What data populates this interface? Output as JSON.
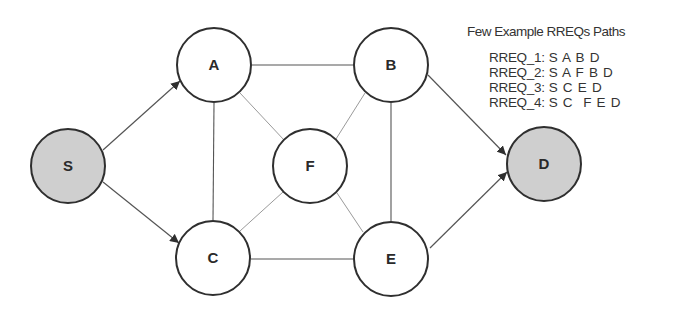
{
  "diagram": {
    "nodes": [
      {
        "id": "S",
        "label": "S",
        "cx": 68,
        "cy": 166,
        "r": 38,
        "fill": "#cfcfcf",
        "role": "source"
      },
      {
        "id": "A",
        "label": "A",
        "cx": 214,
        "cy": 65,
        "r": 38,
        "fill": "#ffffff",
        "role": "intermediate"
      },
      {
        "id": "B",
        "label": "B",
        "cx": 391,
        "cy": 65,
        "r": 38,
        "fill": "#ffffff",
        "role": "intermediate"
      },
      {
        "id": "F",
        "label": "F",
        "cx": 310,
        "cy": 166,
        "r": 38,
        "fill": "#ffffff",
        "role": "intermediate"
      },
      {
        "id": "C",
        "label": "C",
        "cx": 213,
        "cy": 258,
        "r": 38,
        "fill": "#ffffff",
        "role": "intermediate"
      },
      {
        "id": "E",
        "label": "E",
        "cx": 391,
        "cy": 259,
        "r": 38,
        "fill": "#ffffff",
        "role": "intermediate"
      },
      {
        "id": "D",
        "label": "D",
        "cx": 544,
        "cy": 164,
        "r": 38,
        "fill": "#cfcfcf",
        "role": "destination"
      }
    ],
    "edges": [
      {
        "from": "S",
        "to": "A",
        "directed": true
      },
      {
        "from": "S",
        "to": "C",
        "directed": true
      },
      {
        "from": "A",
        "to": "B",
        "directed": false
      },
      {
        "from": "A",
        "to": "C",
        "directed": false
      },
      {
        "from": "A",
        "to": "F",
        "directed": false
      },
      {
        "from": "B",
        "to": "F",
        "directed": false
      },
      {
        "from": "B",
        "to": "E",
        "directed": false
      },
      {
        "from": "C",
        "to": "F",
        "directed": false
      },
      {
        "from": "C",
        "to": "E",
        "directed": false
      },
      {
        "from": "E",
        "to": "F",
        "directed": false
      },
      {
        "from": "B",
        "to": "D",
        "directed": true
      },
      {
        "from": "E",
        "to": "D",
        "directed": true
      }
    ]
  },
  "legend": {
    "title": "Few Example RREQs Paths",
    "items": [
      {
        "label": "RREQ_1:",
        "path": "S A B D"
      },
      {
        "label": "RREQ_2:",
        "path": "S A F B D"
      },
      {
        "label": "RREQ_3:",
        "path": "S C E D"
      },
      {
        "label": "RREQ_4:",
        "path": "S C  F E D"
      }
    ]
  },
  "colors": {
    "node_stroke": "#2f2f2f",
    "edge_dark": "#555555",
    "edge_light": "#9a9a9a",
    "endpoint_fill": "#cfcfcf",
    "text": "#333333"
  }
}
